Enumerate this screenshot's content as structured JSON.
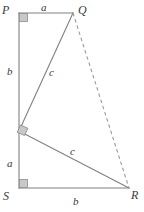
{
  "figure": {
    "kind": "geometry-diagram",
    "width": 144,
    "height": 212,
    "background_color": "#ffffff",
    "line_color": "#808080",
    "dashed_line_color": "#9a9a9a",
    "label_color": "#3a3a3a",
    "right_angle_fill": "#c8c8c8",
    "right_angle_stroke": "#888888"
  },
  "vertices": [
    {
      "id": "P",
      "label": "P",
      "x": 19,
      "y": 13,
      "label_x": 2,
      "label_y": 4
    },
    {
      "id": "Q",
      "label": "Q",
      "x": 73,
      "y": 13,
      "label_x": 78,
      "label_y": 4
    },
    {
      "id": "T",
      "label": "",
      "x": 19,
      "y": 131,
      "label_x": 0,
      "label_y": 0
    },
    {
      "id": "S",
      "label": "S",
      "x": 19,
      "y": 188,
      "label_x": 3,
      "label_y": 190
    },
    {
      "id": "R",
      "label": "R",
      "x": 129,
      "y": 188,
      "label_x": 131,
      "label_y": 189
    }
  ],
  "segments": [
    {
      "id": "PQ",
      "from": "P",
      "to": "Q",
      "style": "solid",
      "label": "a"
    },
    {
      "id": "PT",
      "from": "P",
      "to": "T",
      "style": "solid",
      "label": "b"
    },
    {
      "id": "TS",
      "from": "T",
      "to": "S",
      "style": "solid",
      "label": "a"
    },
    {
      "id": "SR",
      "from": "S",
      "to": "R",
      "style": "solid",
      "label": "b"
    },
    {
      "id": "TQ",
      "from": "T",
      "to": "Q",
      "style": "solid",
      "label": "c"
    },
    {
      "id": "TR",
      "from": "T",
      "to": "R",
      "style": "solid",
      "label": "c"
    },
    {
      "id": "QR",
      "from": "Q",
      "to": "R",
      "style": "dashed",
      "label": ""
    }
  ],
  "side_labels": [
    {
      "id": "label-a-top",
      "text": "a",
      "x": 41,
      "y": 2
    },
    {
      "id": "label-b-left",
      "text": "b",
      "x": 7,
      "y": 66
    },
    {
      "id": "label-c-upper",
      "text": "c",
      "x": 49,
      "y": 67
    },
    {
      "id": "label-a-left",
      "text": "a",
      "x": 7,
      "y": 158
    },
    {
      "id": "label-c-lower",
      "text": "c",
      "x": 70,
      "y": 146
    },
    {
      "id": "label-b-bottom",
      "text": "b",
      "x": 73,
      "y": 196
    }
  ],
  "right_angles": [
    {
      "id": "right-angle-P",
      "at": "P",
      "rotation_deg": 0
    },
    {
      "id": "right-angle-T",
      "at": "T",
      "rotation_deg": 28
    },
    {
      "id": "right-angle-S",
      "at": "S",
      "rotation_deg": 0
    }
  ]
}
